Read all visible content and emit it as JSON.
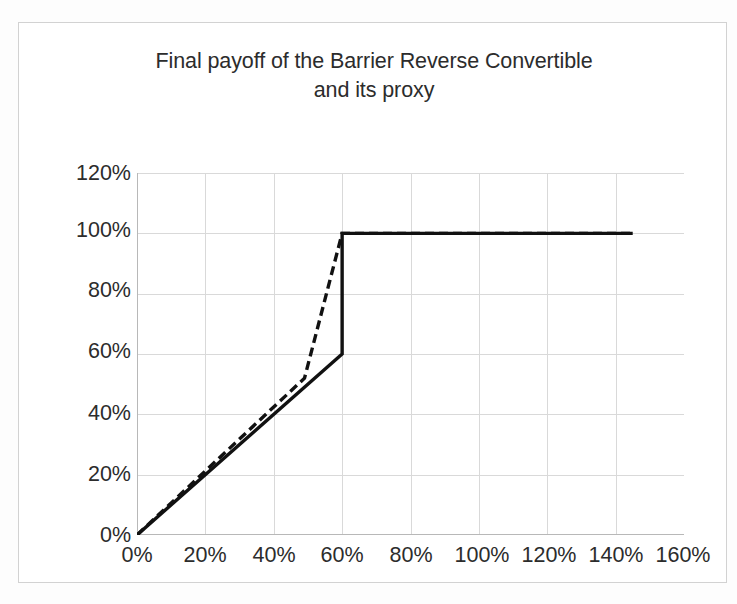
{
  "chart_data": {
    "type": "line",
    "title_line1": "Final payoff of the Barrier Reverse Convertible",
    "title_line2": "and its proxy",
    "xlabel": "",
    "ylabel": "",
    "xlim": [
      0,
      160
    ],
    "ylim": [
      0,
      120
    ],
    "xticks": [
      0,
      20,
      40,
      60,
      80,
      100,
      120,
      140,
      160
    ],
    "yticks": [
      0,
      20,
      40,
      60,
      80,
      100,
      120
    ],
    "xtick_labels": [
      "0%",
      "20%",
      "40%",
      "60%",
      "80%",
      "100%",
      "120%",
      "140%",
      "160%"
    ],
    "ytick_labels": [
      "0%",
      "20%",
      "40%",
      "60%",
      "80%",
      "100%",
      "120%"
    ],
    "grid": true,
    "legend": null,
    "legend_position": "none",
    "series": [
      {
        "name": "Barrier Reverse Convertible",
        "style": "solid",
        "color": "#111111",
        "width": 3.4,
        "x": [
          0,
          60,
          60,
          145
        ],
        "values": [
          0,
          60,
          100,
          100
        ]
      },
      {
        "name": "proxy",
        "style": "dashed",
        "color": "#111111",
        "width": 3.4,
        "dash": "9,5",
        "x": [
          0,
          49,
          60,
          145
        ],
        "values": [
          0,
          52,
          100,
          100
        ]
      }
    ],
    "annotations": []
  },
  "axis": {
    "grid_color": "#d9d9d9",
    "axis_color": "#bfbfbf",
    "text_color": "#2c2c2c"
  }
}
